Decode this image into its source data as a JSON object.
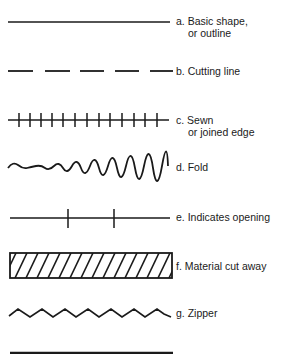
{
  "diagram": {
    "type": "legend of line symbols",
    "items": [
      {
        "id": "a",
        "symbol": "solid-line",
        "label_line1": "a. Basic shape,",
        "label_line2": "or outline"
      },
      {
        "id": "b",
        "symbol": "dashed-line",
        "label_line1": "b. Cutting line"
      },
      {
        "id": "c",
        "symbol": "line-with-cross-ticks",
        "label_line1": "c. Sewn",
        "label_line2": "or joined edge"
      },
      {
        "id": "d",
        "symbol": "wavy-line",
        "label_line1": "d. Fold"
      },
      {
        "id": "e",
        "symbol": "line-with-two-ticks",
        "label_line1": "e. Indicates opening"
      },
      {
        "id": "f",
        "symbol": "hatched-rectangle",
        "label_line1": "f. Material cut away"
      },
      {
        "id": "g",
        "symbol": "zigzag-line",
        "label_line1": "g. Zipper"
      },
      {
        "id": "h",
        "symbol": "thick-line-partially-visible"
      }
    ],
    "stroke_color": "#1a1a1a"
  }
}
